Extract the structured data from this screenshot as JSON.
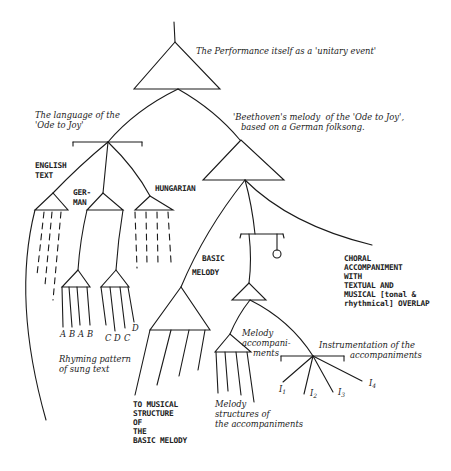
{
  "diagram": {
    "root": {
      "label": "The Performance itself as a 'unitary event'"
    },
    "language": {
      "label_line1": "The language of the",
      "label_line2": "'Ode to Joy'",
      "english": {
        "line1": "ENGLISH",
        "line2": "TEXT"
      },
      "german": {
        "line1": "GER-",
        "line2": "MAN"
      },
      "hungarian": {
        "label": "HUNGARIAN"
      },
      "rhyme_letters": [
        "A",
        "B",
        "A",
        "B",
        "C",
        "D",
        "C",
        "D"
      ],
      "rhyme_caption_line1": "Rhyming pattern",
      "rhyme_caption_line2": "of sung text"
    },
    "melody": {
      "label_line1": "'Beethoven's melody  of the 'Ode to Joy',",
      "label_line2": "based on a German folksong.",
      "basic_melody": {
        "line1": "BASIC",
        "line2": "MELODY"
      },
      "basic_structure": [
        "TO MUSICAL",
        "STRUCTURE",
        "OF",
        "THE",
        "BASIC MELODY"
      ],
      "choral": [
        "CHORAL",
        "ACCOMPANIMENT",
        "WITH",
        "TEXTUAL AND",
        "MUSICAL [tonal &",
        "rhythmical] OVERLAP"
      ],
      "melody_accomp": [
        "Melody",
        "accompani-",
        "ments"
      ],
      "melody_structures": [
        "Melody",
        "structures of",
        "the accompaniments"
      ],
      "instrumentation": {
        "line1": "Instrumentation of the",
        "line2": "accompaniments"
      },
      "instruments": [
        {
          "base": "I",
          "sub": "1"
        },
        {
          "base": "I",
          "sub": "2"
        },
        {
          "base": "I",
          "sub": "3"
        },
        {
          "base": "I",
          "sub": "4"
        }
      ]
    }
  }
}
